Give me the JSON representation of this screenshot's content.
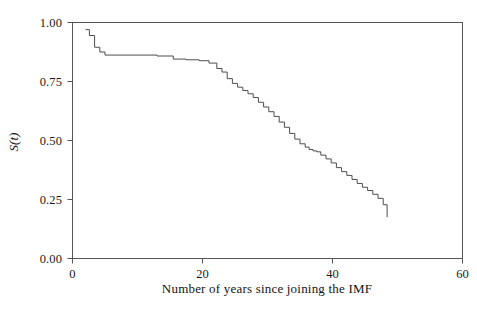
{
  "chart_data": {
    "type": "line",
    "subtype": "kaplan-meier-step",
    "title": "",
    "xlabel": "Number of years since joining the IMF",
    "ylabel": "S(t)",
    "xlim": [
      0,
      60
    ],
    "ylim": [
      0,
      1
    ],
    "grid": false,
    "legend": null,
    "xticks": [
      0,
      20,
      40,
      60
    ],
    "xtick_labels": [
      "0",
      "20",
      "40",
      "60"
    ],
    "yticks": [
      0.0,
      0.25,
      0.5,
      0.75,
      1.0
    ],
    "ytick_labels": [
      "0.00",
      "0.25",
      "0.50",
      "0.75",
      "1.00"
    ],
    "line_color": "#4d4d4d",
    "axis_color": "#555555",
    "background": "#ffffff",
    "series": [
      {
        "name": "survival",
        "step": "post",
        "x": [
          2.0,
          2.6,
          3.4,
          4.2,
          5.0,
          13.0,
          15.5,
          17.5,
          19.5,
          21.0,
          22.2,
          23.0,
          23.8,
          24.6,
          25.4,
          26.2,
          27.0,
          27.8,
          28.6,
          29.4,
          30.2,
          31.0,
          31.8,
          32.6,
          33.4,
          34.2,
          35.0,
          35.8,
          36.4,
          37.0,
          37.6,
          38.2,
          39.0,
          39.8,
          40.6,
          41.4,
          42.2,
          43.0,
          43.8,
          44.6,
          45.4,
          46.2,
          47.0,
          47.8,
          48.4
        ],
        "y": [
          0.97,
          0.945,
          0.895,
          0.875,
          0.862,
          0.858,
          0.845,
          0.842,
          0.838,
          0.828,
          0.805,
          0.79,
          0.762,
          0.742,
          0.726,
          0.712,
          0.698,
          0.682,
          0.662,
          0.642,
          0.622,
          0.602,
          0.578,
          0.556,
          0.53,
          0.506,
          0.486,
          0.472,
          0.462,
          0.456,
          0.452,
          0.438,
          0.422,
          0.405,
          0.385,
          0.368,
          0.352,
          0.335,
          0.318,
          0.302,
          0.288,
          0.272,
          0.255,
          0.228,
          0.175
        ]
      }
    ]
  },
  "axes": {
    "x_tick_labels": [
      "0",
      "20",
      "40",
      "60"
    ],
    "y_tick_labels": [
      "1.00",
      "0.75",
      "0.50",
      "0.25",
      "0.00"
    ],
    "x_axis_title": "Number of years since joining the IMF",
    "y_axis_title": "S(t)"
  }
}
